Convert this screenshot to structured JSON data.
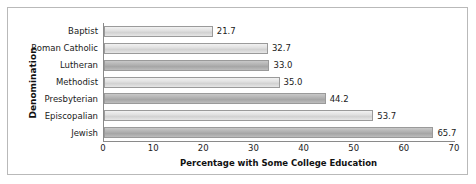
{
  "chart_data": {
    "type": "bar",
    "orientation": "horizontal",
    "title": "",
    "xlabel": "Percentage with Some College Education",
    "ylabel": "Denomination",
    "categories": [
      "Baptist",
      "Roman Catholic",
      "Lutheran",
      "Methodist",
      "Presbyterian",
      "Episcopalian",
      "Jewish"
    ],
    "values": [
      21.7,
      32.7,
      33.0,
      35.0,
      44.2,
      53.7,
      65.7
    ],
    "value_labels": [
      "21.7",
      "32.7",
      "33.0",
      "35.0",
      "44.2",
      "53.7",
      "65.7"
    ],
    "bar_shades": [
      "light",
      "light",
      "dark",
      "light",
      "dark",
      "light",
      "dark"
    ],
    "xlim": [
      0,
      70
    ],
    "xticks": [
      0,
      10,
      20,
      30,
      40,
      50,
      60,
      70
    ],
    "xtick_labels": [
      "0",
      "10",
      "20",
      "30",
      "40",
      "50",
      "60",
      "70"
    ],
    "grid": false,
    "legend": null,
    "colors": {
      "bar_light": "#e2e2e2",
      "bar_dark": "#b4b4b4",
      "bar_border": "#9a9a9a",
      "axis": "#8a8a8a",
      "frame": "#b9b9b9",
      "text": "#1a1a1a",
      "background": "#ffffff"
    }
  }
}
